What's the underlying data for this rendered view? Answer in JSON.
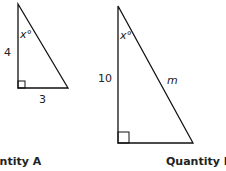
{
  "triangle_a": {
    "side_vertical": "4",
    "side_horizontal": "3",
    "angle_label": "x°"
  },
  "triangle_b": {
    "side_vertical": "10",
    "hypotenuse": "m",
    "angle_label": "x°"
  },
  "quantity_a": {
    "label": "Quantity A"
  },
  "quantity_b": {
    "label": "Quantity B"
  }
}
